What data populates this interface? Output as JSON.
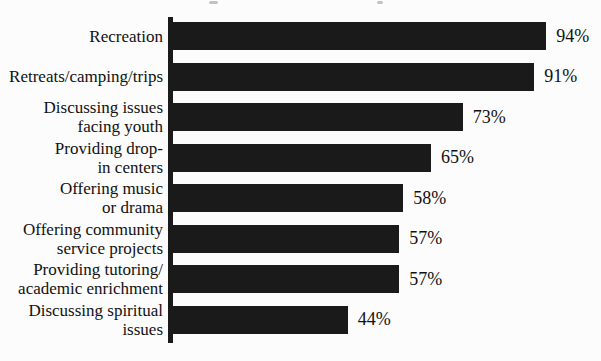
{
  "chart_data": {
    "type": "bar",
    "orientation": "horizontal",
    "title": "",
    "xlabel": "",
    "ylabel": "",
    "xlim": [
      0,
      100
    ],
    "grid": false,
    "legend": false,
    "bar_color": "#1a1a1a",
    "background_color": "#fcfcfc",
    "categories": [
      "Recreation",
      "Retreats/camping/trips",
      "Discussing issues\nfacing youth",
      "Providing drop-\nin centers",
      "Offering music\nor drama",
      "Offering community\nservice projects",
      "Providing tutoring/\nacademic enrichment",
      "Discussing spiritual\nissues"
    ],
    "values": [
      94,
      91,
      73,
      65,
      58,
      57,
      57,
      44
    ],
    "labels": [
      "94%",
      "91%",
      "73%",
      "65%",
      "58%",
      "57%",
      "57%",
      "44%"
    ]
  }
}
